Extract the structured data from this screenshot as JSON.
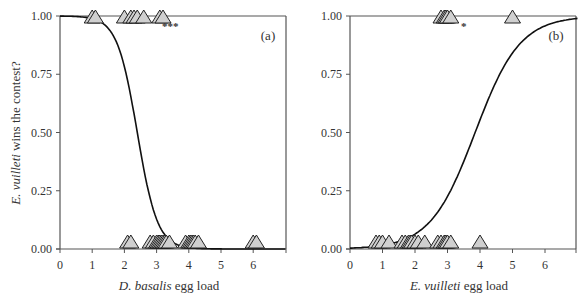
{
  "chart_data": [
    {
      "type": "scatter",
      "panel_label": "(a)",
      "title": "",
      "xlabel_italic": "D. basalis",
      "xlabel_rest": " egg load",
      "ylabel_italic": "E. vuilleti",
      "ylabel_rest": " wins the contest?",
      "xlim": [
        0,
        7
      ],
      "ylim": [
        0,
        1
      ],
      "x_ticks": [
        "0",
        "1",
        "2",
        "3",
        "4",
        "5",
        "6"
      ],
      "y_ticks": [
        "0.00",
        "0.25",
        "0.50",
        "0.75",
        "1.00"
      ],
      "grid": false,
      "significance": "***",
      "curve": {
        "type": "logistic",
        "direction": "decreasing",
        "midpoint_x": 2.4,
        "slope": 3.2
      },
      "points_y1": [
        1.0,
        1.1,
        2.0,
        2.2,
        2.3,
        2.4,
        2.6,
        3.1,
        3.2
      ],
      "points_y0": [
        2.1,
        2.2,
        2.8,
        2.9,
        3.0,
        3.05,
        3.1,
        3.15,
        3.2,
        3.25,
        3.3,
        3.4,
        3.9,
        4.0,
        4.05,
        4.1,
        4.15,
        4.2,
        4.3,
        6.0,
        6.1
      ]
    },
    {
      "type": "scatter",
      "panel_label": "(b)",
      "title": "",
      "xlabel_italic": "E. vuilleti",
      "xlabel_rest": " egg load",
      "xlim": [
        0,
        7
      ],
      "ylim": [
        0,
        1
      ],
      "x_ticks": [
        "0",
        "1",
        "2",
        "3",
        "4",
        "5",
        "6"
      ],
      "y_ticks": [
        "0.00",
        "0.25",
        "0.50",
        "0.75",
        "1.00"
      ],
      "grid": false,
      "significance": "*",
      "curve": {
        "type": "logistic",
        "direction": "increasing",
        "midpoint_x": 3.85,
        "slope": 1.45
      },
      "points_y1": [
        2.8,
        2.9,
        2.95,
        3.0,
        3.1,
        5.0
      ],
      "points_y0": [
        0.8,
        0.9,
        1.0,
        1.2,
        1.6,
        1.7,
        1.8,
        1.85,
        1.9,
        2.0,
        2.1,
        2.3,
        2.7,
        2.8,
        2.9,
        2.95,
        3.0,
        3.1,
        4.0
      ]
    }
  ],
  "colors": {
    "axis": "#555555",
    "curve": "#111111",
    "marker_fill": "#d0d0d0",
    "marker_stroke": "#222222"
  }
}
